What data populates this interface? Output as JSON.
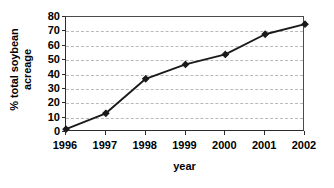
{
  "chart_data": {
    "type": "line",
    "title": "",
    "xlabel": "year",
    "ylabel_line1": "% total soybean",
    "ylabel_line2": "acreage",
    "ylabel": "% total soybean acreage",
    "categories": [
      "1996",
      "1997",
      "1998",
      "1999",
      "2000",
      "2001",
      "2002"
    ],
    "values": [
      2,
      13,
      37,
      47,
      54,
      68,
      75
    ],
    "ylim": [
      0,
      80
    ],
    "ytick_labels": [
      "0",
      "10",
      "20",
      "30",
      "40",
      "50",
      "60",
      "70",
      "80"
    ],
    "ytick_values": [
      0,
      10,
      20,
      30,
      40,
      50,
      60,
      70,
      80
    ],
    "gridline_values": [
      10,
      20,
      30,
      40,
      50,
      60,
      70
    ],
    "grid": "horizontal-dashed",
    "legend": "none",
    "series": [
      {
        "name": "% total soybean acreage",
        "values": [
          2,
          13,
          37,
          47,
          54,
          68,
          75
        ],
        "line_color": "#1a1a1a",
        "marker": "filled-diamond",
        "marker_color": "#1a1a1a"
      }
    ],
    "colors": {
      "line": "#1a1a1a",
      "marker": "#1a1a1a",
      "axis": "#2b2b2b",
      "gridline": "#b9b9b9",
      "background": "#ffffff",
      "text": "#000000"
    }
  }
}
